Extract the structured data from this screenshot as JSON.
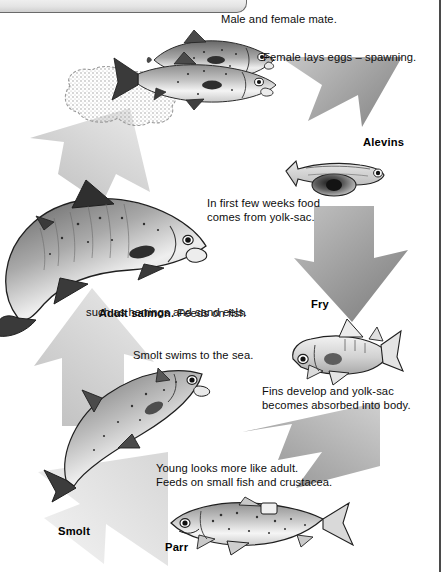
{
  "diagram": {
    "type": "cycle-diagram"
  },
  "annotations": {
    "mate": "Male and female mate.",
    "spawning": "Female lays eggs – spawning.",
    "yolk_sac_line1": "In first few weeks food",
    "yolk_sac_line2": "comes from yolk-sac.",
    "fins_line1": "Fins develop and yolk-sac",
    "fins_line2": "becomes absorbed into body.",
    "young_line1": "Young looks more like adult.",
    "young_line2": "Feeds on small fish and crustacea.",
    "smolt_sea": "Smolt swims to the sea.",
    "adult_bold": "Adult salmon.",
    "adult_rest": " Feeds on fish",
    "adult_line2": "such as herrings and sand eels."
  },
  "stage_labels": {
    "alevins": "Alevins",
    "fry": "Fry",
    "parr": "Parr",
    "smolt": "Smolt"
  },
  "colors": {
    "arrow_dark": "#8a8a8a",
    "arrow_light": "#d6d6d6",
    "ink": "#111111",
    "page_bg": "#ffffff",
    "border": "#4a4a4a"
  },
  "stages": [
    {
      "name": "Adults spawning",
      "label": "",
      "note": "Male and female mate. Female lays eggs – spawning."
    },
    {
      "name": "Alevins",
      "label": "Alevins",
      "note": "In first few weeks food comes from yolk-sac."
    },
    {
      "name": "Fry",
      "label": "Fry",
      "note": "Fins develop and yolk-sac becomes absorbed into body."
    },
    {
      "name": "Parr",
      "label": "Parr",
      "note": "Young looks more like adult. Feeds on small fish and crustacea."
    },
    {
      "name": "Smolt",
      "label": "Smolt",
      "note": "Smolt swims to the sea."
    },
    {
      "name": "Adult salmon",
      "label": "Adult salmon",
      "note": "Feeds on fish such as herrings and sand eels."
    }
  ]
}
